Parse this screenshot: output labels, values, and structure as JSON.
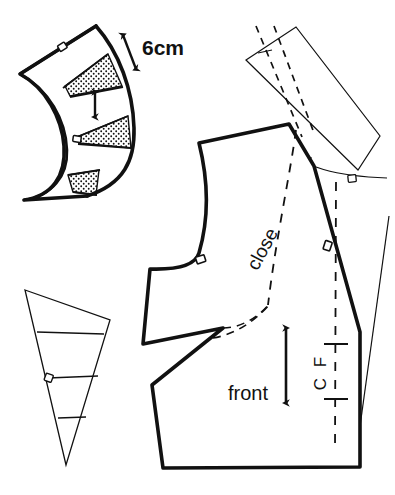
{
  "document": {
    "type": "sewing-pattern-diagram",
    "title": "",
    "background_color": "#ffffff",
    "ink_color": "#111111",
    "width": 395,
    "height": 495
  },
  "labels": {
    "measurement": "6cm",
    "close": "close",
    "front": "front",
    "center_front": "C F",
    "center_front_letters": [
      "C",
      "F"
    ]
  },
  "pieces": [
    {
      "id": "collar-fan",
      "name": "collar-fan-piece",
      "position": "top-left",
      "description": "curved crescent collar slashed and spread into wedges",
      "line_weight": "heavy",
      "wedge_count": 3,
      "wedge_fill": "stipple",
      "notch_count": 2,
      "spread_arrow": "double-headed-vertical",
      "measurement_label": "6cm"
    },
    {
      "id": "side-wedge",
      "name": "side-panel-wedge",
      "position": "bottom-left",
      "description": "narrow tapered wedge with three horizontal balance lines",
      "line_weight": "thin",
      "balance_line_count": 3,
      "notch_count": 1
    },
    {
      "id": "front-bodice",
      "name": "front-bodice-piece",
      "position": "center-right",
      "description": "front bodice block with open dart wedge, armhole and centre front",
      "line_weight": "heavy",
      "label": "front",
      "notch_count": 2,
      "grainline": "double-headed-vertical-arrow",
      "centre_front_line": "dashed-with-crossbars",
      "close_guide": "dashed-curve"
    },
    {
      "id": "facing",
      "name": "facing-piece",
      "position": "top-right",
      "description": "rotated quadrilateral facing overlapping the shoulder",
      "line_weight": "thin",
      "dashed_guides": 2,
      "notch_count": 1
    }
  ],
  "markers": {
    "notch": "square-notch-marker",
    "grainline_arrow": "double-arrow-icon",
    "spread_arrow": "double-arrow-icon",
    "measure_arrow": "double-arrow-icon"
  }
}
